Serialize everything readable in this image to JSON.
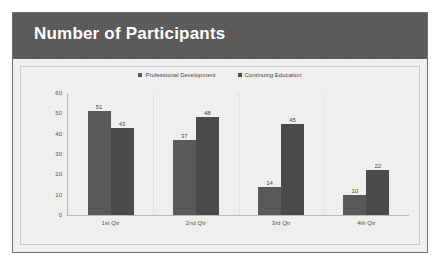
{
  "slide": {
    "title": "Number of Participants"
  },
  "chart_data": {
    "type": "bar",
    "title": "Number of Participants",
    "xlabel": "",
    "ylabel": "",
    "ylim": [
      0,
      60
    ],
    "yticks": [
      0,
      10,
      20,
      30,
      40,
      50,
      60
    ],
    "grid": true,
    "legend_position": "top",
    "categories": [
      "1st Qtr",
      "2nd Qtr",
      "3rd Qtr",
      "4th Qtr"
    ],
    "series": [
      {
        "name": "Professional Development",
        "color": "#595959",
        "values": [
          51,
          37,
          14,
          10
        ]
      },
      {
        "name": "Continuing Education",
        "color": "#4a4a4a",
        "values": [
          43,
          48,
          45,
          22
        ]
      }
    ]
  },
  "colors": {
    "title_band": "#5a5a5a",
    "title_text": "#ffffff",
    "panel_bg": "#f1f1f1",
    "frame_border": "#6d6d6d",
    "axis": "#b9b9b9",
    "gridline": "#e2e2e2",
    "tick_text": "#555555"
  }
}
